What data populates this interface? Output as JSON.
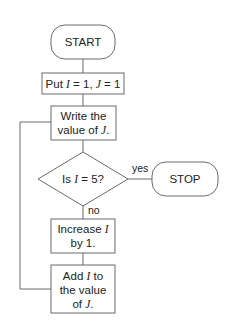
{
  "diagram": {
    "type": "flowchart",
    "colors": {
      "line": "#6b6b6b",
      "text": "#222222",
      "background": "#ffffff"
    },
    "nodes": {
      "start": {
        "shape": "terminal",
        "label": "START"
      },
      "init": {
        "shape": "process",
        "label_parts": [
          "Put ",
          "I",
          " = 1, ",
          "J",
          " = 1"
        ]
      },
      "write": {
        "shape": "process",
        "line1": "Write the",
        "line2_parts": [
          "value of ",
          "J",
          "."
        ]
      },
      "decision": {
        "shape": "decision",
        "label_parts": [
          "Is ",
          "I",
          " = 5?"
        ]
      },
      "stop": {
        "shape": "terminal",
        "label": "STOP"
      },
      "increase": {
        "shape": "process",
        "line1_parts": [
          "Increase ",
          "I"
        ],
        "line2": "by 1."
      },
      "add": {
        "shape": "process",
        "line1_parts": [
          "Add ",
          "I",
          " to"
        ],
        "line2": "the value",
        "line3_parts": [
          "of ",
          "J",
          "."
        ]
      }
    },
    "edges": {
      "yes": "yes",
      "no": "no"
    }
  }
}
